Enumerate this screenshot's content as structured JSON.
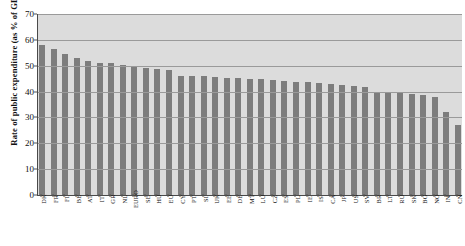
{
  "chart_data": {
    "type": "bar",
    "title": "",
    "xlabel": "",
    "ylabel": "Rate of public expenditure (as % of GDP)",
    "ylim": [
      0,
      70
    ],
    "ytick_step": 10,
    "yticks": [
      0,
      10,
      20,
      30,
      40,
      50,
      60,
      70
    ],
    "grid": true,
    "legend": false,
    "bar_color": "#7d7d7d",
    "plot_background": "#dcdcdc",
    "categories": [
      "DK",
      "FR",
      "FI",
      "BE",
      "AT",
      "IT",
      "GR",
      "NL",
      "EURO",
      "SE",
      "HU",
      "EU",
      "CY",
      "PT",
      "SI",
      "UK",
      "EE",
      "DE",
      "MT",
      "LU",
      "CZ",
      "ES",
      "PL",
      "IE",
      "IS",
      "CA",
      "JP",
      "US",
      "SV",
      "BR",
      "LT",
      "RU",
      "SK",
      "BG",
      "NO",
      "IN",
      "CN"
    ],
    "values": [
      58.1,
      56.3,
      54.4,
      52.8,
      51.8,
      51.2,
      51.2,
      50.3,
      49.9,
      49.3,
      48.9,
      48.5,
      46.2,
      46.0,
      45.9,
      45.7,
      45.4,
      45.2,
      45.0,
      44.8,
      44.5,
      44.2,
      43.9,
      43.6,
      43.2,
      42.9,
      42.6,
      42.2,
      41.9,
      39.6,
      39.4,
      39.3,
      39.1,
      38.6,
      37.9,
      32.2,
      27.2
    ]
  },
  "axis": {
    "y_title": "Rate of public expenditure (as % of GDP)"
  }
}
